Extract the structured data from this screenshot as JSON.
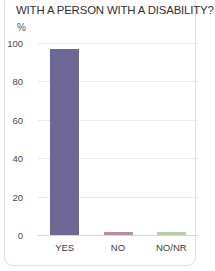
{
  "card": {
    "title": "WITH A PERSON WITH A DISABILITY?"
  },
  "chart_data": {
    "type": "bar",
    "title": "WITH A PERSON WITH A DISABILITY?",
    "xlabel": "",
    "ylabel": "%",
    "unit_label": "%",
    "ylim": [
      0,
      100
    ],
    "yticks": [
      "0",
      "20",
      "40",
      "60",
      "80",
      "100"
    ],
    "ytick_values": [
      0,
      20,
      40,
      60,
      80,
      100
    ],
    "grid": true,
    "legend": "none",
    "categories": [
      "YES",
      "NO",
      "NO/NR"
    ],
    "values": [
      97,
      1.5,
      1.5
    ],
    "colors": [
      "#6d6794",
      "#b08fa6",
      "#b5cdad"
    ],
    "series": [
      {
        "name": "share",
        "values": [
          97,
          1.5,
          1.5
        ]
      }
    ]
  }
}
